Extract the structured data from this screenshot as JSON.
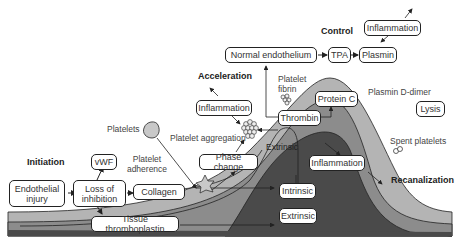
{
  "phases": {
    "initiation": "Initiation",
    "acceleration": "Acceleration",
    "control": "Control",
    "recanalization": "Recanalization"
  },
  "boxes": {
    "endothelial_injury": "Endothelial injury",
    "loss_of_inhibition": "Loss of inhibition",
    "vwf": "vWF",
    "collagen": "Collagen",
    "tissue_thromboplastin": "Tissue thromboplastin",
    "phase_change": "Phase change",
    "inflammation_accel": "Inflammation",
    "thrombin": "Thrombin",
    "normal_endothelium": "Normal endothelium",
    "tpa": "TPA",
    "plasmin": "Plasmin",
    "inflammation_control": "Inflammation",
    "protein_c": "Protein C",
    "lysis": "Lysis",
    "inflammation_center": "Inflammation",
    "intrinsic": "Intrinsic",
    "extrinsic": "Extrinsic"
  },
  "labels": {
    "platelets": "Platelets",
    "platelet_adherence": "Platelet adherence",
    "platelet_aggregation": "Platelet aggregation",
    "platelet_fibrin": "Platelet fibrin",
    "extrinsic_band": "Extrinsic",
    "plasmin_d_dimer": "Plasmin D-dimer",
    "spent_platelets": "Spent platelets"
  },
  "colors": {
    "light_band": "#b4b4b4",
    "mid_band": "#8c8c8c",
    "dark_band": "#4a4a4a",
    "line": "#222222"
  }
}
